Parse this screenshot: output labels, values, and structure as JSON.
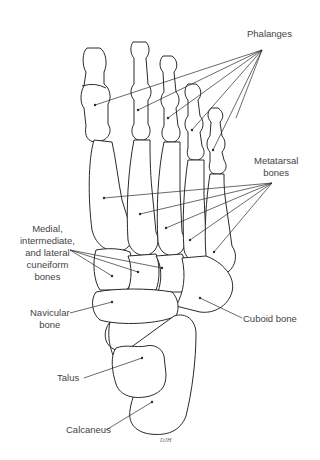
{
  "figure": {
    "labels": {
      "phalanges": "Phalanges",
      "metatarsal_line1": "Metatarsal",
      "metatarsal_line2": "bones",
      "cuneiform_line1": "Medial,",
      "cuneiform_line2": "intermediate,",
      "cuneiform_line3": "and lateral",
      "cuneiform_line4": "cuneiform",
      "cuneiform_line5": "bones",
      "navicular_line1": "Navicular",
      "navicular_line2": "bone",
      "cuboid": "Cuboid bone",
      "talus": "Talus",
      "calcaneus": "Calcaneus"
    },
    "signature": "DJH",
    "colors": {
      "line": "#2a2a2a",
      "text": "#444444",
      "background": "#ffffff"
    }
  }
}
